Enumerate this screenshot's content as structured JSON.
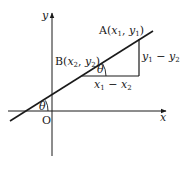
{
  "diagram": {
    "axes": {
      "x_label": "x",
      "y_label": "y",
      "origin_label": "O"
    },
    "points": {
      "A": {
        "name": "A",
        "x": "x",
        "x_sub": "1",
        "y": "y",
        "y_sub": "1"
      },
      "B": {
        "name": "B",
        "x": "x",
        "x_sub": "2",
        "y": "y",
        "y_sub": "2"
      }
    },
    "run_label": {
      "a": "x",
      "a_sub": "1",
      "op": " − ",
      "b": "x",
      "b_sub": "2"
    },
    "rise_label": {
      "a": "y",
      "a_sub": "1",
      "op": " − ",
      "b": "y",
      "b_sub": "2"
    },
    "angle_label": "θ",
    "colors": {
      "stroke": "#1a1a1a",
      "background": "#ffffff"
    }
  }
}
